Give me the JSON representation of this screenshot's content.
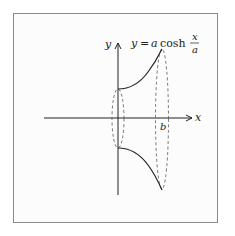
{
  "diagram": {
    "equation": {
      "lhs": "y",
      "equals": "=",
      "coef": "a",
      "func": "cosh",
      "frac_num": "x",
      "frac_den": "a"
    },
    "axes": {
      "x_label": "x",
      "y_label": "y",
      "b_label": "b"
    },
    "colors": {
      "curve": "#222222",
      "axis": "#222222",
      "dashed": "#555555",
      "frame": "#8a8a8a"
    }
  }
}
